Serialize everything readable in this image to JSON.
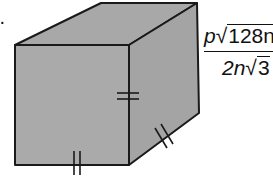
{
  "problem": {
    "label_fragment": ":."
  },
  "cube": {
    "face_color": "#a9a9a9",
    "edge_color": "#1a1a1a",
    "tick_marks": [
      {
        "edge": "front-right-vertical",
        "count": 2
      },
      {
        "edge": "right-bottom-depth",
        "count": 2
      },
      {
        "edge": "front-bottom",
        "count": 2
      }
    ]
  },
  "formula": {
    "numerator": {
      "coef": "p",
      "radical_sign": "√",
      "radicand": "128n"
    },
    "denominator": {
      "coef": "2n",
      "radical_sign": "√",
      "radicand": "3"
    }
  }
}
